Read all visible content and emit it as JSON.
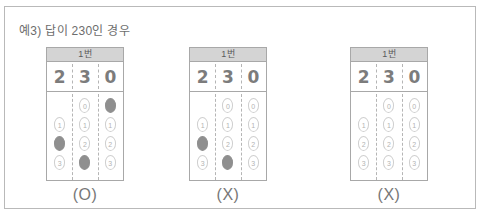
{
  "panel": {
    "caption": "예3) 답이 230인 경우",
    "border_color": "#b9b9b9"
  },
  "colors": {
    "header_bg": "#d4d4d4",
    "filled_bubble": "#8f8f8f",
    "empty_bubble_border": "#cfcfcf",
    "text_gray": "#7c7c7c",
    "card_border": "#a8a8a8"
  },
  "cards": [
    {
      "header": "1번",
      "handwritten": [
        "2",
        "3",
        "0"
      ],
      "verdict": "(O)",
      "columns": [
        {
          "bubbles": [
            {
              "label": "",
              "filled": false,
              "blank": true
            },
            {
              "label": "1",
              "filled": false,
              "blank": false
            },
            {
              "label": "2",
              "filled": true,
              "blank": false
            },
            {
              "label": "3",
              "filled": false,
              "blank": false
            }
          ]
        },
        {
          "bubbles": [
            {
              "label": "0",
              "filled": false,
              "blank": false
            },
            {
              "label": "1",
              "filled": false,
              "blank": false
            },
            {
              "label": "2",
              "filled": false,
              "blank": false
            },
            {
              "label": "3",
              "filled": true,
              "blank": false
            }
          ]
        },
        {
          "bubbles": [
            {
              "label": "0",
              "filled": true,
              "blank": false
            },
            {
              "label": "1",
              "filled": false,
              "blank": false
            },
            {
              "label": "2",
              "filled": false,
              "blank": false
            },
            {
              "label": "3",
              "filled": false,
              "blank": false
            }
          ]
        }
      ]
    },
    {
      "header": "1번",
      "handwritten": [
        "2",
        "3",
        "0"
      ],
      "verdict": "(X)",
      "columns": [
        {
          "bubbles": [
            {
              "label": "",
              "filled": false,
              "blank": true
            },
            {
              "label": "1",
              "filled": false,
              "blank": false
            },
            {
              "label": "2",
              "filled": true,
              "blank": false
            },
            {
              "label": "3",
              "filled": false,
              "blank": false
            }
          ]
        },
        {
          "bubbles": [
            {
              "label": "0",
              "filled": false,
              "blank": false
            },
            {
              "label": "1",
              "filled": false,
              "blank": false
            },
            {
              "label": "2",
              "filled": false,
              "blank": false
            },
            {
              "label": "3",
              "filled": true,
              "blank": false
            }
          ]
        },
        {
          "bubbles": [
            {
              "label": "0",
              "filled": false,
              "blank": false
            },
            {
              "label": "1",
              "filled": false,
              "blank": false
            },
            {
              "label": "2",
              "filled": false,
              "blank": false
            },
            {
              "label": "3",
              "filled": false,
              "blank": false
            }
          ]
        }
      ]
    },
    {
      "header": "1번",
      "handwritten": [
        "2",
        "3",
        "0"
      ],
      "verdict": "(X)",
      "columns": [
        {
          "bubbles": [
            {
              "label": "",
              "filled": false,
              "blank": true
            },
            {
              "label": "1",
              "filled": false,
              "blank": false
            },
            {
              "label": "2",
              "filled": false,
              "blank": false
            },
            {
              "label": "3",
              "filled": false,
              "blank": false
            }
          ]
        },
        {
          "bubbles": [
            {
              "label": "0",
              "filled": false,
              "blank": false
            },
            {
              "label": "1",
              "filled": false,
              "blank": false
            },
            {
              "label": "2",
              "filled": false,
              "blank": false
            },
            {
              "label": "3",
              "filled": false,
              "blank": false
            }
          ]
        },
        {
          "bubbles": [
            {
              "label": "0",
              "filled": false,
              "blank": false
            },
            {
              "label": "1",
              "filled": false,
              "blank": false
            },
            {
              "label": "2",
              "filled": false,
              "blank": false
            },
            {
              "label": "3",
              "filled": false,
              "blank": false
            }
          ]
        }
      ]
    }
  ]
}
